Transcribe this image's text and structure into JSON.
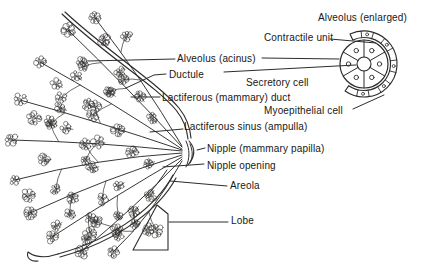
{
  "labels": {
    "alveolus_enlarged": "Alveolus (enlarged)",
    "contractile_unit": "Contractile unit",
    "alveolus_acinus": "Alveolus (acinus)",
    "ductule": "Ductule",
    "secretory_cell": "Secretory cell",
    "lactiferous_duct": "Lactiferous (mammary) duct",
    "myoepithelial_cell": "Myoepithelial cell",
    "lactiferous_sinus": "Lactiferous sinus (ampulla)",
    "nipple": "Nipple (mammary papilla)",
    "nipple_opening": "Nipple opening",
    "areola": "Areola",
    "lobe": "Lobe"
  },
  "colors": {
    "ink": "#2e2c2b",
    "background": "#ffffff"
  }
}
